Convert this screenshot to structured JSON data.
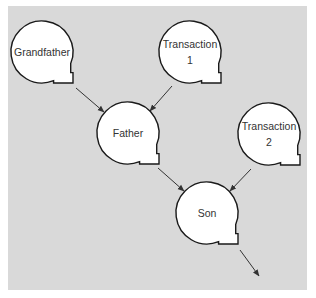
{
  "diagram": {
    "colors": {
      "panel": "#d9d9d9",
      "bubble_fill": "#ffffff",
      "bubble_stroke": "#1a1a1a",
      "arrow": "#333333"
    },
    "nodes": [
      {
        "id": "grandfather",
        "lines": [
          "Grandfather"
        ],
        "cx": 42,
        "cy": 52,
        "r": 31
      },
      {
        "id": "transaction1",
        "lines": [
          "Transaction",
          "1"
        ],
        "cx": 190,
        "cy": 52,
        "r": 31
      },
      {
        "id": "father",
        "lines": [
          "Father"
        ],
        "cx": 128,
        "cy": 133,
        "r": 31
      },
      {
        "id": "transaction2",
        "lines": [
          "Transaction",
          "2"
        ],
        "cx": 269,
        "cy": 134,
        "r": 31
      },
      {
        "id": "son",
        "lines": [
          "Son"
        ],
        "cx": 207,
        "cy": 213,
        "r": 31
      }
    ],
    "edges": [
      {
        "from": "grandfather",
        "to": "father",
        "x1": 76,
        "y1": 88,
        "x2": 104,
        "y2": 112
      },
      {
        "from": "transaction1",
        "to": "father",
        "x1": 172,
        "y1": 86,
        "x2": 150,
        "y2": 111
      },
      {
        "from": "father",
        "to": "son",
        "x1": 158,
        "y1": 168,
        "x2": 184,
        "y2": 191
      },
      {
        "from": "transaction2",
        "to": "son",
        "x1": 251,
        "y1": 169,
        "x2": 230,
        "y2": 191
      },
      {
        "from": "son",
        "to": "next",
        "x1": 240,
        "y1": 250,
        "x2": 259,
        "y2": 276
      }
    ]
  }
}
